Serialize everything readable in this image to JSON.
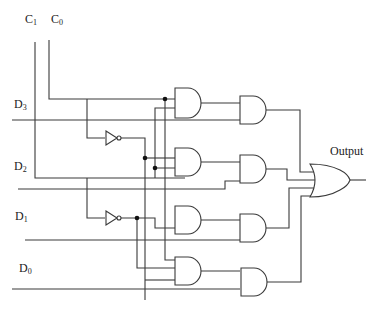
{
  "diagram": {
    "select_inputs": [
      {
        "id": "C1",
        "base": "C",
        "sub": "1"
      },
      {
        "id": "C0",
        "base": "C",
        "sub": "0"
      }
    ],
    "data_inputs": [
      {
        "id": "D3",
        "base": "D",
        "sub": "3"
      },
      {
        "id": "D2",
        "base": "D",
        "sub": "2"
      },
      {
        "id": "D1",
        "base": "D",
        "sub": "1"
      },
      {
        "id": "D0",
        "base": "D",
        "sub": "0"
      }
    ],
    "output_label": "Output",
    "gates": {
      "not": 2,
      "and_decoder": 4,
      "and_data": 4,
      "or": 1
    },
    "colors": {
      "wire": "#3a3a3a",
      "junction": "#111111",
      "background": "#ffffff"
    }
  }
}
